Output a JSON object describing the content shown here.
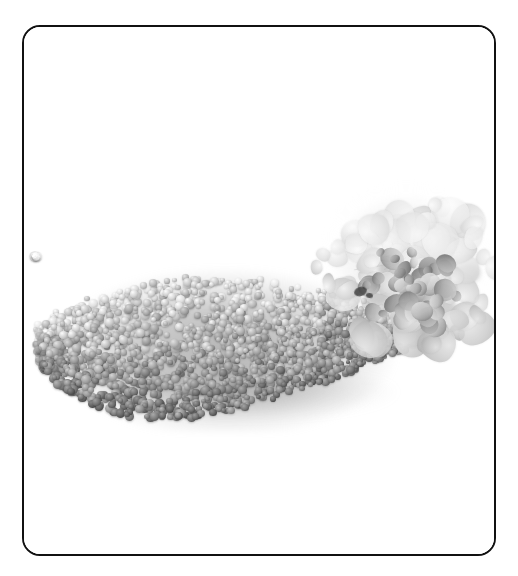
{
  "image": {
    "subject": "pile-of-gray-granules-with-white-flower-cluster",
    "medium": "grayscale-photograph",
    "background_color": "#ffffff",
    "has_visible_text": false,
    "alt_text": "Grayscale photo of a mound of small spherical granules beside a white flower cluster"
  },
  "frame": {
    "border_color": "#111111",
    "border_width_px": 2,
    "corner_radius_px": 18,
    "x": 22,
    "y": 25,
    "width": 474,
    "height": 531
  },
  "palette": {
    "background": "#ffffff",
    "granule_light": "#d8d8d8",
    "granule_mid": "#b0b0b0",
    "granule_dark": "#7a7a7a",
    "granule_shadow": "#5c5c5c",
    "flower_white": "#ffffff",
    "flower_light_gray": "#ededed",
    "flower_mid_gray": "#c9c9c9",
    "flower_shadow": "#8e8e8e",
    "contact_shadow": "#8a8a8a"
  },
  "regions": {
    "granule_pile": {
      "label": "granule-pile",
      "left": 30,
      "top": 250,
      "right": 425,
      "bottom": 400
    },
    "flower_cluster": {
      "label": "flower-cluster",
      "left": 290,
      "top": 165,
      "right": 478,
      "bottom": 330
    }
  }
}
